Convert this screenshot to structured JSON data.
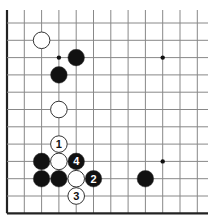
{
  "board": {
    "grid": {
      "x_lines": [
        7,
        24.3,
        41.6,
        58.9,
        76.2,
        93.5,
        110.8,
        128.1,
        145.4,
        162.7,
        180,
        197.3
      ],
      "y_lines": [
        23,
        40.3,
        57.6,
        74.9,
        92.2,
        109.5,
        126.8,
        144.1,
        161.4,
        178.7,
        196,
        213.3
      ],
      "left_edge": true,
      "bottom_edge": true,
      "line_color": "#888888",
      "edge_color": "#222222"
    },
    "star_points": [
      {
        "col": 3,
        "row": 2
      },
      {
        "col": 9,
        "row": 2
      },
      {
        "col": 9,
        "row": 8
      }
    ],
    "stones": [
      {
        "color": "white",
        "col": 2,
        "row": 1,
        "label": ""
      },
      {
        "color": "black",
        "col": 4,
        "row": 2,
        "label": ""
      },
      {
        "color": "black",
        "col": 3,
        "row": 3,
        "label": ""
      },
      {
        "color": "white",
        "col": 3,
        "row": 5,
        "label": ""
      },
      {
        "color": "white",
        "col": 3,
        "row": 7,
        "label": "1"
      },
      {
        "color": "black",
        "col": 2,
        "row": 8,
        "label": ""
      },
      {
        "color": "white",
        "col": 3,
        "row": 8,
        "label": ""
      },
      {
        "color": "black",
        "col": 4,
        "row": 8,
        "label": "4"
      },
      {
        "color": "black",
        "col": 2,
        "row": 9,
        "label": ""
      },
      {
        "color": "black",
        "col": 3,
        "row": 9,
        "label": ""
      },
      {
        "color": "white",
        "col": 4,
        "row": 9,
        "label": ""
      },
      {
        "color": "black",
        "col": 5,
        "row": 9,
        "label": "2"
      },
      {
        "color": "black",
        "col": 8,
        "row": 9,
        "label": ""
      },
      {
        "color": "white",
        "col": 4,
        "row": 10,
        "label": "3"
      }
    ],
    "stone_radius": 8.3,
    "colors": {
      "black": "#111111",
      "white": "#ffffff",
      "stone_outline": "#333333"
    }
  }
}
